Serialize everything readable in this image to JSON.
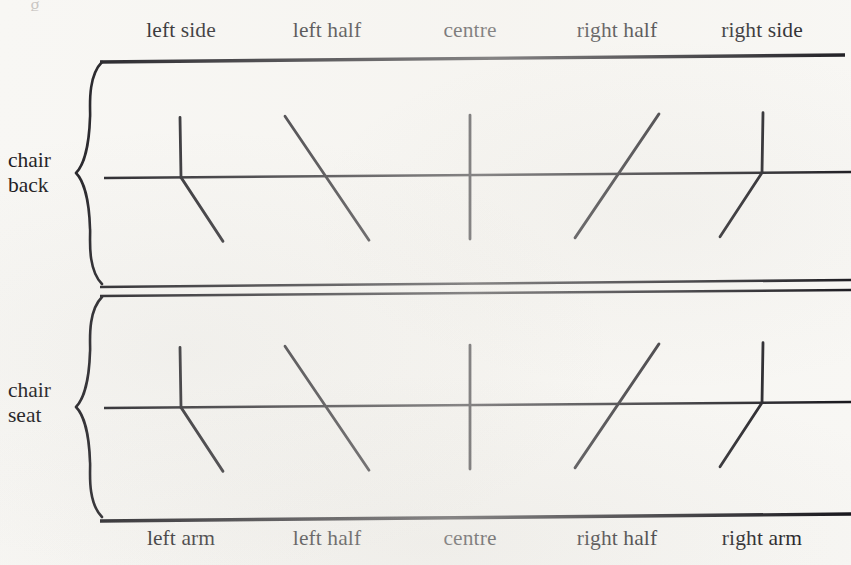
{
  "figure": {
    "name": "chair-region-coding-diagram",
    "background_color": "#f8f7f4",
    "ink_color": "#15141a",
    "width": 851,
    "height": 565,
    "ghost_text_top": "g"
  },
  "top_labels": [
    {
      "text": "left side",
      "x": 181
    },
    {
      "text": "left half",
      "x": 327
    },
    {
      "text": "centre",
      "x": 470
    },
    {
      "text": "right half",
      "x": 617
    },
    {
      "text": "right side",
      "x": 762
    }
  ],
  "bottom_labels": [
    {
      "text": "left arm",
      "x": 181
    },
    {
      "text": "left half",
      "x": 327
    },
    {
      "text": "centre",
      "x": 470
    },
    {
      "text": "right half",
      "x": 617
    },
    {
      "text": "right arm",
      "x": 762
    }
  ],
  "row_labels": [
    {
      "line1": "chair",
      "line2": "back",
      "x": 8,
      "y": 148
    },
    {
      "line1": "chair",
      "line2": "seat",
      "x": 8,
      "y": 378
    }
  ],
  "sections": [
    {
      "name": "chair-back",
      "top_rule_y": 60,
      "axis_y": 176,
      "bottom_rule_y": 285,
      "marks": [
        {
          "kind": "vertical-up-diagonal-down-right",
          "x": 181
        },
        {
          "kind": "diagonal-backslash",
          "x": 327
        },
        {
          "kind": "vertical-cross",
          "x": 470
        },
        {
          "kind": "diagonal-forwardslash",
          "x": 617
        },
        {
          "kind": "vertical-up-diagonal-down-left",
          "x": 762
        }
      ]
    },
    {
      "name": "chair-seat",
      "top_rule_y": 295,
      "axis_y": 406,
      "bottom_rule_y": 518,
      "marks": [
        {
          "kind": "vertical-up-diagonal-down-right",
          "x": 181
        },
        {
          "kind": "diagonal-backslash",
          "x": 327
        },
        {
          "kind": "vertical-cross",
          "x": 470
        },
        {
          "kind": "diagonal-forwardslash",
          "x": 617
        },
        {
          "kind": "vertical-up-diagonal-down-left",
          "x": 762
        }
      ]
    }
  ],
  "braces": [
    {
      "name": "chair-back-brace",
      "x": 92,
      "y_top": 62,
      "y_bottom": 284
    },
    {
      "name": "chair-seat-brace",
      "x": 92,
      "y_top": 297,
      "y_bottom": 517
    }
  ],
  "rules": [
    {
      "name": "top-rule",
      "y_left": 62,
      "y_right": 55,
      "x1": 100,
      "x2": 845,
      "width": 3.4
    },
    {
      "name": "chair-back-axis",
      "y_left": 178,
      "y_right": 172,
      "x1": 104,
      "x2": 851,
      "width": 2.6
    },
    {
      "name": "divider-rule-upper",
      "y_left": 287,
      "y_right": 280,
      "x1": 100,
      "x2": 851,
      "width": 2.6
    },
    {
      "name": "divider-rule-lower",
      "y_left": 296,
      "y_right": 290,
      "x1": 100,
      "x2": 851,
      "width": 2.6
    },
    {
      "name": "chair-seat-axis",
      "y_left": 408,
      "y_right": 402,
      "x1": 104,
      "x2": 851,
      "width": 2.6
    },
    {
      "name": "bottom-rule",
      "y_left": 521,
      "y_right": 514,
      "x1": 100,
      "x2": 851,
      "width": 3.4
    }
  ]
}
